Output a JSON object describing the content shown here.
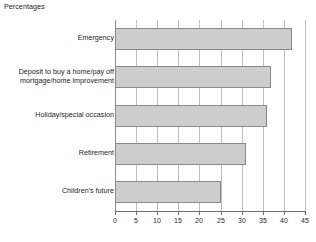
{
  "chart_data": {
    "type": "bar",
    "orientation": "horizontal",
    "title": "Percentages",
    "xlabel": "",
    "ylabel": "",
    "xlim": [
      0,
      45
    ],
    "xticks": [
      0,
      5,
      10,
      15,
      20,
      25,
      30,
      35,
      40,
      45
    ],
    "grid": true,
    "legend": false,
    "categories": [
      "Emergency",
      "Deposit to buy a home/pay off\nmortgage/home improvement",
      "Holiday/special occasion",
      "Retirement",
      "Children's future"
    ],
    "values": [
      42,
      37,
      36,
      31,
      25
    ],
    "bars": [
      {
        "label": "Emergency",
        "value": 42
      },
      {
        "label": "Deposit to buy a home/pay off mortgage/home improvement",
        "value": 37
      },
      {
        "label": "Holiday/special occasion",
        "value": 36
      },
      {
        "label": "Retirement",
        "value": 31
      },
      {
        "label": "Children's future",
        "value": 25
      }
    ],
    "colors": {
      "bar_fill": "#cdcdcd",
      "bar_stroke": "#8a8a8a",
      "gridline": "#bfbfbf",
      "axis": "#6d6e70",
      "text": "#231f20",
      "background": "#ffffff"
    }
  }
}
